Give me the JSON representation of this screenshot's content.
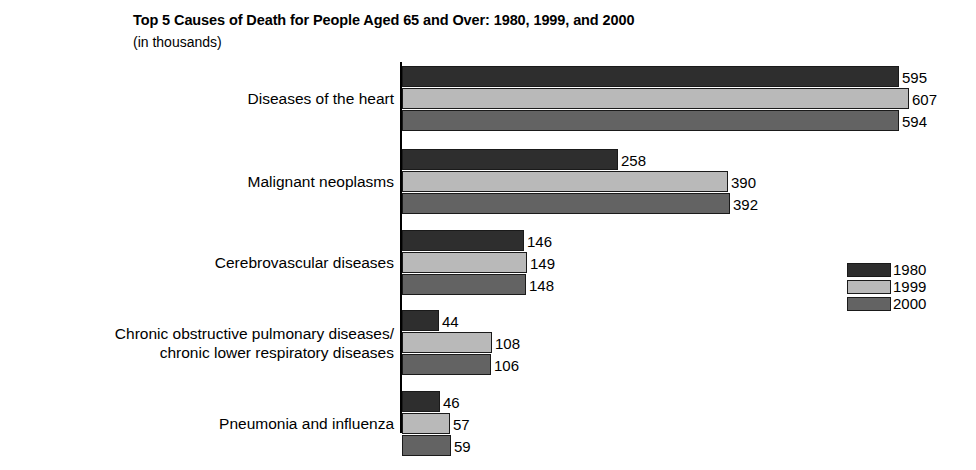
{
  "chart_data": {
    "type": "bar",
    "orientation": "horizontal",
    "title": "Top 5 Causes of Death for People Aged 65 and Over: 1980, 1999, and 2000",
    "subtitle": "(in thousands)",
    "xlabel": "",
    "ylabel": "",
    "units": "thousands",
    "grid": false,
    "legend_position": "right",
    "xlim": [
      0,
      650
    ],
    "categories": [
      "Diseases of the heart",
      "Malignant neoplasms",
      "Cerebrovascular diseases",
      "Chronic obstructive pulmonary diseases/\nchronic lower respiratory diseases",
      "Pneumonia and influenza"
    ],
    "category_lines": [
      [
        "Diseases of the heart"
      ],
      [
        "Malignant neoplasms"
      ],
      [
        "Cerebrovascular diseases"
      ],
      [
        "Chronic obstructive pulmonary diseases/",
        "chronic lower respiratory diseases"
      ],
      [
        "Pneumonia and influenza"
      ]
    ],
    "series": [
      {
        "name": "1980",
        "color": "#2e2e2e",
        "values": [
          595,
          258,
          146,
          44,
          46
        ]
      },
      {
        "name": "1999",
        "color": "#b9b9b9",
        "values": [
          607,
          390,
          149,
          108,
          57
        ]
      },
      {
        "name": "2000",
        "color": "#636363",
        "values": [
          594,
          392,
          148,
          106,
          59
        ]
      }
    ],
    "value_labels": [
      [
        "595",
        "607",
        "594"
      ],
      [
        "258",
        "390",
        "392"
      ],
      [
        "146",
        "149",
        "148"
      ],
      [
        "44",
        "108",
        "106"
      ],
      [
        "46",
        "57",
        "59"
      ]
    ]
  },
  "legend": {
    "items": [
      {
        "label": "1980",
        "color": "#2e2e2e"
      },
      {
        "label": "1999",
        "color": "#b9b9b9"
      },
      {
        "label": "2000",
        "color": "#636363"
      }
    ]
  }
}
